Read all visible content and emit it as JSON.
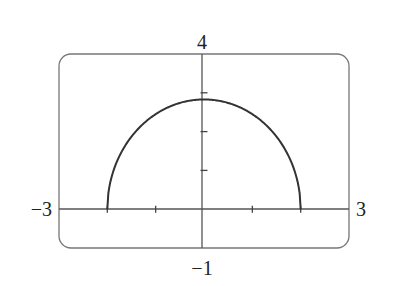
{
  "chart_data": {
    "type": "line",
    "title": "",
    "xlabel": "",
    "ylabel": "",
    "xlim": [
      -3,
      3
    ],
    "ylim": [
      -1,
      4
    ],
    "grid": false,
    "legend": null,
    "axis_labels": {
      "x_min": "−3",
      "x_max": "3",
      "y_min": "−1",
      "y_max": "4"
    },
    "x_ticks": [
      -2,
      -1,
      0,
      1,
      2
    ],
    "y_ticks": [
      1,
      2,
      3
    ],
    "series": [
      {
        "name": "y = sqrt(8 - 2x^2)",
        "x": [
          -2,
          -1.9,
          -1.75,
          -1.5,
          -1.25,
          -1,
          -0.75,
          -0.5,
          -0.25,
          0,
          0.25,
          0.5,
          0.75,
          1,
          1.25,
          1.5,
          1.75,
          1.9,
          2
        ],
        "y": [
          0,
          0.88,
          1.37,
          1.87,
          2.21,
          2.45,
          2.62,
          2.74,
          2.81,
          2.83,
          2.81,
          2.74,
          2.62,
          2.45,
          2.21,
          1.87,
          1.37,
          0.88,
          0
        ]
      }
    ],
    "colors": {
      "curve": "#333333",
      "axes": "#555555",
      "frame": "#777777"
    }
  }
}
